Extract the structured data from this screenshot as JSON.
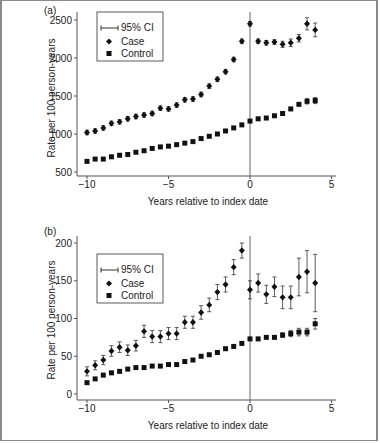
{
  "chart_data": [
    {
      "panel": "(a)",
      "type": "scatter",
      "xlabel": "Years relative to index date",
      "ylabel": "Rate per 100 person-years",
      "xlim": [
        -10,
        5
      ],
      "ylim": [
        500,
        2600
      ],
      "xticks": [
        -10,
        -5,
        0,
        5
      ],
      "xtick_labels": [
        "−10",
        "−5",
        "0",
        "5"
      ],
      "yticks": [
        500,
        1000,
        1500,
        2000,
        2500
      ],
      "ytick_labels": [
        "500",
        "1000",
        "1500",
        "2000",
        "2500"
      ],
      "vline_x": 0,
      "legend": [
        "95% CI",
        "Case",
        "Control"
      ],
      "legend_position": "upper left",
      "x": [
        -10,
        -9.5,
        -9,
        -8.5,
        -8,
        -7.5,
        -7,
        -6.5,
        -6,
        -5.5,
        -5,
        -4.5,
        -4,
        -3.5,
        -3,
        -2.5,
        -2,
        -1.5,
        -1,
        -0.5,
        0,
        0.5,
        1,
        1.5,
        2,
        2.5,
        3,
        3.5,
        4
      ],
      "series": [
        {
          "name": "Case",
          "marker": "diamond",
          "values": [
            1020,
            1040,
            1080,
            1140,
            1160,
            1200,
            1230,
            1250,
            1270,
            1340,
            1330,
            1380,
            1450,
            1460,
            1520,
            1630,
            1720,
            1820,
            1980,
            2220,
            2450,
            2220,
            2200,
            2210,
            2180,
            2200,
            2260,
            2450,
            2370
          ],
          "ci_halfwidth": [
            30,
            30,
            30,
            30,
            30,
            30,
            30,
            30,
            30,
            30,
            30,
            30,
            30,
            30,
            30,
            30,
            30,
            30,
            30,
            30,
            30,
            30,
            30,
            30,
            40,
            50,
            50,
            80,
            90
          ]
        },
        {
          "name": "Control",
          "marker": "square",
          "values": [
            640,
            670,
            670,
            700,
            720,
            730,
            760,
            780,
            810,
            830,
            840,
            860,
            880,
            900,
            940,
            970,
            1000,
            1040,
            1080,
            1120,
            1170,
            1200,
            1210,
            1240,
            1270,
            1330,
            1390,
            1430,
            1440
          ],
          "ci_halfwidth": [
            10,
            10,
            10,
            10,
            10,
            10,
            10,
            10,
            10,
            10,
            10,
            10,
            10,
            10,
            10,
            10,
            10,
            10,
            10,
            10,
            10,
            10,
            10,
            10,
            10,
            15,
            25,
            35,
            40
          ]
        }
      ]
    },
    {
      "panel": "(b)",
      "type": "scatter",
      "xlabel": "Years relative to index date",
      "ylabel": "Rate per 100 person-years",
      "xlim": [
        -10,
        5
      ],
      "ylim": [
        0,
        205
      ],
      "xticks": [
        -10,
        -5,
        0,
        5
      ],
      "xtick_labels": [
        "−10",
        "−5",
        "0",
        "5"
      ],
      "yticks": [
        0,
        50,
        100,
        150,
        200
      ],
      "ytick_labels": [
        "0",
        "50",
        "100",
        "150",
        "200"
      ],
      "vline_x": 0,
      "legend": [
        "95% CI",
        "Case",
        "Control"
      ],
      "legend_position": "upper left",
      "x": [
        -10,
        -9.5,
        -9,
        -8.5,
        -8,
        -7.5,
        -7,
        -6.5,
        -6,
        -5.5,
        -5,
        -4.5,
        -4,
        -3.5,
        -3,
        -2.5,
        -2,
        -1.5,
        -1,
        -0.5,
        0,
        0.5,
        1,
        1.5,
        2,
        2.5,
        3,
        3.5,
        4
      ],
      "series": [
        {
          "name": "Case",
          "marker": "diamond",
          "values": [
            30,
            38,
            45,
            57,
            62,
            58,
            64,
            83,
            76,
            76,
            80,
            80,
            95,
            95,
            108,
            118,
            135,
            145,
            168,
            190,
            138,
            147,
            132,
            142,
            128,
            128,
            155,
            162,
            147
          ],
          "ci_halfwidth": [
            6,
            6,
            6,
            7,
            7,
            7,
            7,
            8,
            8,
            8,
            8,
            8,
            8,
            8,
            9,
            9,
            10,
            10,
            10,
            10,
            12,
            12,
            12,
            13,
            15,
            15,
            25,
            28,
            38
          ]
        },
        {
          "name": "Control",
          "marker": "square",
          "values": [
            15,
            20,
            25,
            28,
            30,
            33,
            35,
            35,
            37,
            37,
            39,
            39,
            43,
            45,
            50,
            52,
            55,
            60,
            63,
            67,
            73,
            73,
            75,
            75,
            78,
            80,
            82,
            82,
            93
          ],
          "ci_halfwidth": [
            1,
            1,
            1,
            1,
            1,
            1,
            1,
            1,
            1,
            1,
            1,
            1,
            1,
            1,
            1,
            1,
            1,
            1,
            1,
            1,
            2,
            2,
            2,
            2,
            3,
            4,
            5,
            5,
            7
          ]
        }
      ]
    }
  ],
  "labels": {
    "panel_a": "(a)",
    "panel_b": "(b)",
    "xlabel": "Years relative to index date",
    "ylabel": "Rate per 100 person-years",
    "legend_ci": "95% CI",
    "legend_case": "Case",
    "legend_control": "Control"
  }
}
